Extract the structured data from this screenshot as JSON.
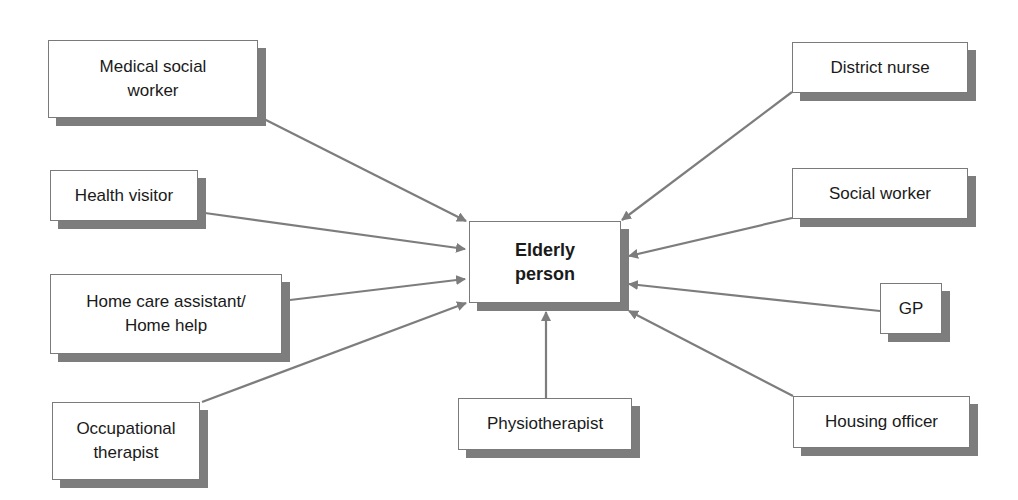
{
  "diagram": {
    "center": {
      "id": "elderly",
      "label": "Elderly\nperson"
    },
    "nodes": [
      {
        "id": "medical-social-worker",
        "label": "Medical social\nworker"
      },
      {
        "id": "health-visitor",
        "label": "Health visitor"
      },
      {
        "id": "home-care-assistant",
        "label": "Home care assistant/\nHome help"
      },
      {
        "id": "occupational-therapist",
        "label": "Occupational\ntherapist"
      },
      {
        "id": "physiotherapist",
        "label": "Physiotherapist"
      },
      {
        "id": "district-nurse",
        "label": "District nurse"
      },
      {
        "id": "social-worker",
        "label": "Social worker"
      },
      {
        "id": "gp",
        "label": "GP"
      },
      {
        "id": "housing-officer",
        "label": "Housing officer"
      }
    ],
    "edges": [
      {
        "from": "medical-social-worker",
        "to": "elderly"
      },
      {
        "from": "health-visitor",
        "to": "elderly"
      },
      {
        "from": "home-care-assistant",
        "to": "elderly"
      },
      {
        "from": "occupational-therapist",
        "to": "elderly"
      },
      {
        "from": "physiotherapist",
        "to": "elderly"
      },
      {
        "from": "district-nurse",
        "to": "elderly"
      },
      {
        "from": "social-worker",
        "to": "elderly"
      },
      {
        "from": "gp",
        "to": "elderly"
      },
      {
        "from": "housing-officer",
        "to": "elderly"
      }
    ],
    "colors": {
      "arrow": "#7d7d7d",
      "shadow": "#7d7d7d",
      "border": "#7a7a7a"
    }
  }
}
